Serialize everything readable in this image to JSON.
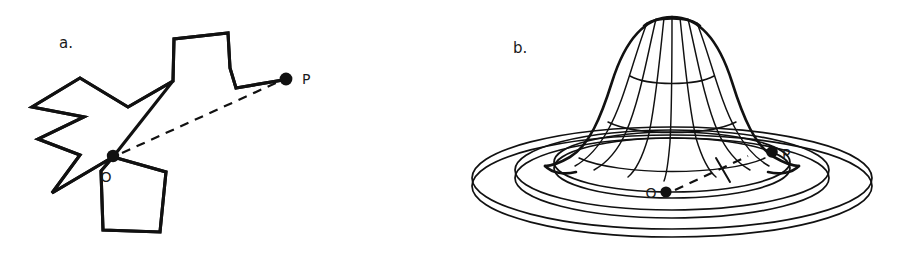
{
  "figure": {
    "background_color": "#ffffff",
    "ink_color": "#111111",
    "panels": [
      {
        "id": "a",
        "label": "a.",
        "caption_kind": "irregular-star-polygon-with-interior-point",
        "points": [
          {
            "name": "O",
            "label": "O",
            "role": "origin-point",
            "x": 113,
            "y": 156
          },
          {
            "name": "P",
            "label": "P",
            "role": "boundary-point",
            "x": 286,
            "y": 79
          }
        ],
        "connector": {
          "style": "dashed",
          "from": "O",
          "to": "P"
        }
      },
      {
        "id": "b",
        "label": "b.",
        "caption_kind": "bell-surface-over-concentric-rings",
        "points": [
          {
            "name": "O",
            "label": "O",
            "role": "origin-point",
            "x": 665,
            "y": 190
          },
          {
            "name": "P",
            "label": "P",
            "role": "boundary-point",
            "x": 771,
            "y": 152
          }
        ],
        "connector": {
          "style": "dashed",
          "from": "O",
          "to": "P"
        },
        "rings": 3,
        "meridians": 7,
        "parallels": 3
      }
    ]
  }
}
